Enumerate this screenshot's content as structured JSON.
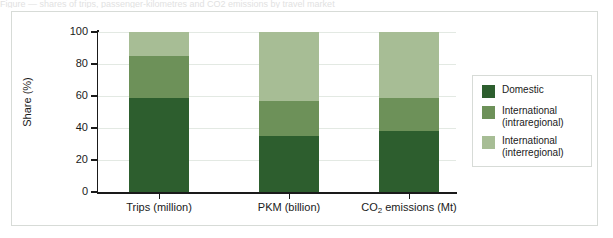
{
  "top_caption": "Figure — shares of trips, passenger-kilometres and CO2 emissions by travel market",
  "frame": {
    "border_color": "#d7dbd7",
    "background": "#ffffff"
  },
  "chart_data": {
    "type": "bar",
    "subtype": "stacked-100-percent",
    "title": "",
    "xlabel": "",
    "ylabel": "Share (%)",
    "ylim": [
      0,
      100
    ],
    "yticks": [
      0,
      20,
      40,
      60,
      80,
      100
    ],
    "ytick_labels": [
      "0",
      "20",
      "40",
      "60",
      "80",
      "100"
    ],
    "grid": true,
    "grid_color": "#e3e9e3",
    "legend_position": "right",
    "categories": [
      {
        "label": "Trips (million)",
        "html": "Trips (million)"
      },
      {
        "label": "PKM (billion)",
        "html": "PKM (billion)"
      },
      {
        "label": "CO2 emissions (Mt)",
        "html": "CO<sub>2</sub> emissions (Mt)"
      }
    ],
    "series": [
      {
        "name": "Domestic",
        "color": "#2d5e2e",
        "values": [
          59,
          35,
          38
        ]
      },
      {
        "name": "International (intraregional)",
        "color": "#6d9159",
        "values": [
          26,
          22,
          21
        ]
      },
      {
        "name": "International (interregional)",
        "color": "#a7bd95",
        "values": [
          15,
          43,
          41
        ]
      }
    ],
    "legend": [
      {
        "label_line1": "Domestic",
        "label_line2": "",
        "color": "#2d5e2e"
      },
      {
        "label_line1": "International",
        "label_line2": "(intraregional)",
        "color": "#6d9159"
      },
      {
        "label_line1": "International",
        "label_line2": "(interregional)",
        "color": "#a7bd95"
      }
    ]
  }
}
